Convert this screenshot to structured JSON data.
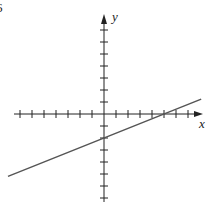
{
  "figure": {
    "number_label": "6",
    "x_axis_label": "x",
    "y_axis_label": "y"
  },
  "colors": {
    "axis": "#222222",
    "line": "#555555",
    "background": "#ffffff"
  },
  "chart_data": {
    "type": "line",
    "title": "",
    "xlabel": "x",
    "ylabel": "y",
    "x_ticks": [
      -7,
      -6,
      -5,
      -4,
      -3,
      -2,
      -1,
      1,
      2,
      3,
      4,
      5,
      6,
      7
    ],
    "y_ticks": [
      -7,
      -6,
      -5,
      -4,
      -3,
      -2,
      -1,
      1,
      2,
      3,
      4,
      5,
      6,
      7
    ],
    "tick_labels_shown": false,
    "grid": false,
    "xlim": [
      -8,
      8
    ],
    "ylim": [
      -7.5,
      8
    ],
    "series": [
      {
        "name": "line",
        "equation": "y = (2/5)x - 2",
        "slope": 0.4,
        "y_intercept": -2,
        "x_intercept": 5,
        "x": [
          -8,
          8.1
        ],
        "y": [
          -5.2,
          1.24
        ]
      }
    ]
  }
}
